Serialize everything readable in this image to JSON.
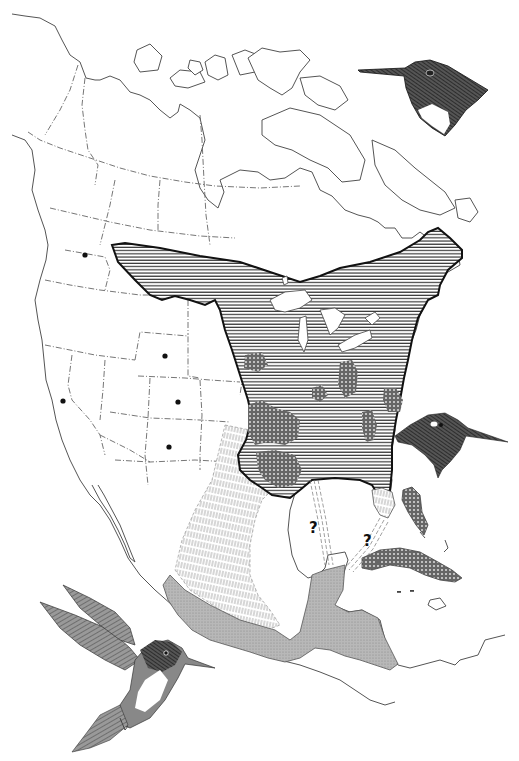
{
  "map": {
    "subject": "Hummingbird breeding and wintering range, North and Central America",
    "colors": {
      "background": "#ffffff",
      "outline": "#555555",
      "breeding_hatch": "#222222",
      "dense_hatch": "#333333",
      "migration_hatch": "#777777",
      "winter_fill": "#a9a9a9"
    },
    "legend_regions": [
      {
        "id": "breeding-range",
        "pattern": "horizontal-lines",
        "area": "Eastern North America, southern Canada to Gulf Coast"
      },
      {
        "id": "dense-breeding-areas",
        "pattern": "crosshatch",
        "area": "Patches in southeastern US"
      },
      {
        "id": "migration-route",
        "pattern": "vertical-dashed-lines",
        "area": "Texas and eastern Mexico"
      },
      {
        "id": "winter-range",
        "pattern": "stippled-gray",
        "area": "Southern Mexico and Central America"
      },
      {
        "id": "caribbean-records",
        "pattern": "crosshatch",
        "area": "Cuba and Bahamas"
      }
    ],
    "question_marks": [
      {
        "label": "?",
        "x": 315,
        "y": 527
      },
      {
        "label": "?",
        "x": 369,
        "y": 540
      }
    ],
    "location_dots": [
      {
        "x": 85,
        "y": 255
      },
      {
        "x": 165,
        "y": 356
      },
      {
        "x": 63,
        "y": 401
      },
      {
        "x": 178,
        "y": 402
      },
      {
        "x": 169,
        "y": 447
      }
    ],
    "illustrations": [
      {
        "id": "bird-head-top-right",
        "description": "Male hummingbird head, dark throat"
      },
      {
        "id": "bird-head-right",
        "description": "Hummingbird head profile"
      },
      {
        "id": "bird-hovering-bottom-left",
        "description": "Hovering hummingbird with spread wings"
      }
    ]
  }
}
